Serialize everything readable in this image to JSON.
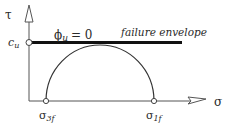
{
  "diagram": {
    "axes": {
      "y_label": "τ",
      "x_label": "σ"
    },
    "envelope": {
      "label": "failure envelope",
      "phi_label_symbol": "ϕ",
      "phi_label_subscript": "u",
      "phi_label_value": "= 0"
    },
    "intercept": {
      "symbol": "c",
      "subscript": "u"
    },
    "circle_points": [
      {
        "symbol": "σ",
        "subscript": "3f"
      },
      {
        "symbol": "σ",
        "subscript": "1f"
      }
    ],
    "colors": {
      "line": "#3a3a3a",
      "envelope": "#111111",
      "text": "#2a2a2a",
      "background": "#ffffff"
    }
  }
}
